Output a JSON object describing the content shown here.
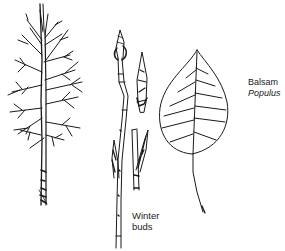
{
  "figure": {
    "species_label": {
      "common_name": "Balsam",
      "scientific_name": "Populus"
    },
    "buds_label": {
      "line1": "Winter",
      "line2": "buds"
    },
    "illustrations": [
      {
        "name": "tree-silhouette",
        "description": "bare tree in winter"
      },
      {
        "name": "twig-with-buds",
        "description": "twig with terminal and lateral winter buds"
      },
      {
        "name": "bud-detail-upper",
        "description": "detached bud, closeup"
      },
      {
        "name": "bud-detail-lower",
        "description": "twig section with lateral bud"
      },
      {
        "name": "leaf",
        "description": "ovate leaf with pinnate venation and long petiole"
      }
    ],
    "colors": {
      "ink": "#1a1a1a",
      "background": "#ffffff"
    }
  }
}
